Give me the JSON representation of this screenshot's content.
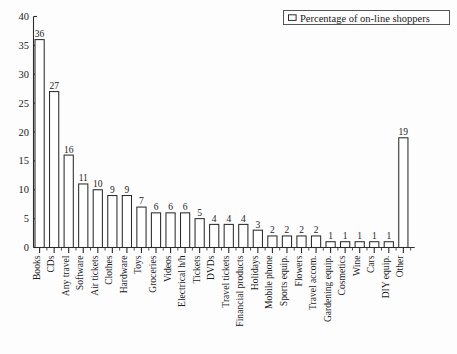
{
  "legend": {
    "label": "Percentage of on-line shoppers",
    "swatch_icon": "empty-square-icon"
  },
  "chart_data": {
    "type": "bar",
    "title": "",
    "xlabel": "",
    "ylabel": "",
    "ylim": [
      0,
      40
    ],
    "ytick_labels": [
      "0",
      "5",
      "10",
      "15",
      "20",
      "25",
      "30",
      "35",
      "40"
    ],
    "ytick_values": [
      0,
      5,
      10,
      15,
      20,
      25,
      30,
      35,
      40
    ],
    "grid": false,
    "legend_position": "top-right",
    "legend_entries": [
      "Percentage of on-line shoppers"
    ],
    "categories": [
      "Books",
      "CDs",
      "Any travel",
      "Software",
      "Air tickets",
      "Clothes",
      "Hardware",
      "Toys",
      "Groceries",
      "Videos",
      "Electrical h/h",
      "Tickets",
      "DVDs",
      "Travel tickets",
      "Financial products",
      "Holidays",
      "Mobile phone",
      "Sports equip.",
      "Flowers",
      "Travel accom.",
      "Gardening equip.",
      "Cosmetics",
      "Wine",
      "Cars",
      "DIY equip.",
      "Other"
    ],
    "values": [
      36,
      27,
      16,
      11,
      10,
      9,
      9,
      7,
      6,
      6,
      6,
      5,
      4,
      4,
      4,
      3,
      2,
      2,
      2,
      2,
      1,
      1,
      1,
      1,
      1,
      19
    ],
    "data_labels": [
      "36",
      "27",
      "16",
      "11",
      "10",
      "9",
      "9",
      "7",
      "6",
      "6",
      "6",
      "5",
      "4",
      "4",
      "4",
      "3",
      "2",
      "2",
      "2",
      "2",
      "1",
      "1",
      "1",
      "1",
      "1",
      "19"
    ],
    "bar_fill": "#ffffff",
    "bar_stroke": "#2b2b2b"
  }
}
